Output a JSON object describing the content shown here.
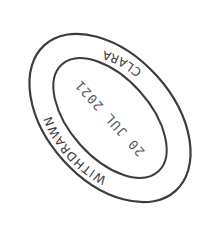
{
  "stamp": {
    "top_text": "WITHDRAWN",
    "bottom_text": "CLARA",
    "date": "20 JUL 2021",
    "ink_color": "#3a3a3a",
    "background": "#ffffff",
    "orientation": "rotated upside-down, tilted ~45°"
  }
}
